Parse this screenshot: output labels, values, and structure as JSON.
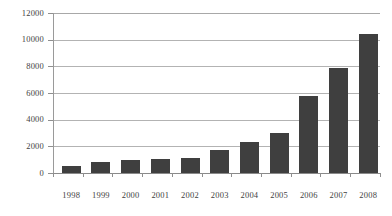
{
  "chart_data": {
    "type": "bar",
    "title": "",
    "subtitle": "",
    "xlabel": "",
    "ylabel": "",
    "categories": [
      "1998",
      "1999",
      "2000",
      "2001",
      "2002",
      "2003",
      "2004",
      "2005",
      "2006",
      "2007",
      "2008"
    ],
    "values": [
      500,
      800,
      950,
      1050,
      1150,
      1750,
      2350,
      3000,
      5800,
      7900,
      10400
    ],
    "series": [
      {
        "name": "",
        "values": [
          500,
          800,
          950,
          1050,
          1150,
          1750,
          2350,
          3000,
          5800,
          7900,
          10400
        ]
      }
    ],
    "ylim": [
      0,
      12000
    ],
    "yticks": [
      0,
      2000,
      4000,
      6000,
      8000,
      10000,
      12000
    ],
    "ytick_labels": [
      "0",
      "2000",
      "4000",
      "6000",
      "8000",
      "10000",
      "12000"
    ],
    "grid": true,
    "grid_axis": "y",
    "legend": false,
    "legend_position": "none",
    "bar_color": "#3f3f3f",
    "grid_color": "#b3b3b3",
    "axis_color": "#9a9a9a",
    "text_color": "#3f3f3f",
    "background": "#ffffff"
  }
}
